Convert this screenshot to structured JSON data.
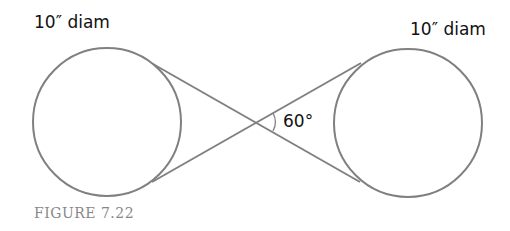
{
  "diagram": {
    "left_label": "10″ diam",
    "right_label": "10″ diam",
    "angle_label": "60°",
    "caption": "FIGURE 7.22",
    "stroke_color": "#808080"
  }
}
